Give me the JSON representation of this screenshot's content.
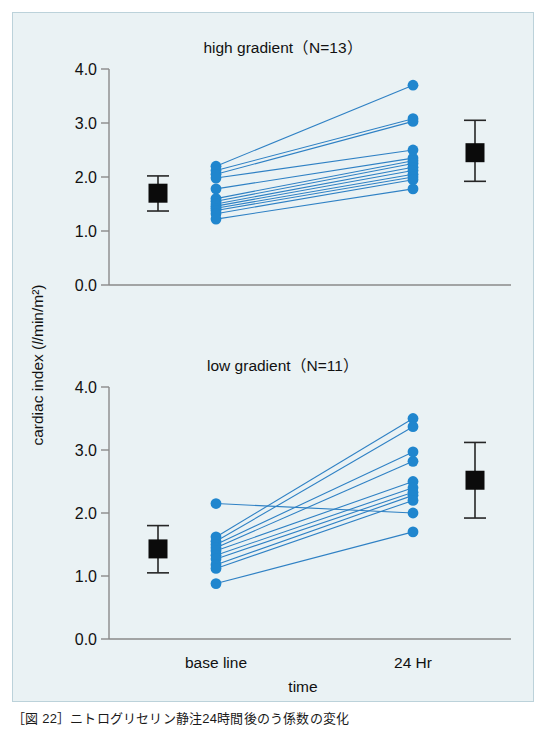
{
  "figure": {
    "caption": "［図 22］ニトログリセリン静注24時間後のう係数の変化",
    "background_color": "#eaf2f4",
    "point_color": "#2086ce",
    "link_color": "#2f81c4",
    "marker_color": "#0b0b0b"
  },
  "axes": {
    "y_label_prefix": "cardiac index (",
    "y_label_unit": "l",
    "y_label_suffix": "/min/m²)",
    "y_label_full": "cardiac index (l/min/m²)",
    "x_label": "time",
    "y_ticks": [
      "0.0",
      "1.0",
      "2.0",
      "3.0",
      "4.0"
    ],
    "x_categories": [
      "base line",
      "24 Hr"
    ]
  },
  "chart_data": [
    {
      "type": "line",
      "title": "high gradient（N=13）",
      "panel": "high-gradient",
      "n": 13,
      "xlabel": "time",
      "ylabel": "cardiac index (l/min/m²)",
      "ylim": [
        0.0,
        4.0
      ],
      "yticks": [
        0.0,
        1.0,
        2.0,
        3.0,
        4.0
      ],
      "x": [
        "base line",
        "24 Hr"
      ],
      "grid": false,
      "legend": "none",
      "series": [
        {
          "name": "subject-1",
          "values": [
            2.2,
            3.7
          ]
        },
        {
          "name": "subject-2",
          "values": [
            2.12,
            3.08
          ]
        },
        {
          "name": "subject-3",
          "values": [
            2.05,
            3.03
          ]
        },
        {
          "name": "subject-4",
          "values": [
            1.98,
            2.5
          ]
        },
        {
          "name": "subject-5",
          "values": [
            1.78,
            2.35
          ]
        },
        {
          "name": "subject-6",
          "values": [
            1.6,
            2.3
          ]
        },
        {
          "name": "subject-7",
          "values": [
            1.55,
            2.25
          ]
        },
        {
          "name": "subject-8",
          "values": [
            1.5,
            2.18
          ]
        },
        {
          "name": "subject-9",
          "values": [
            1.46,
            2.12
          ]
        },
        {
          "name": "subject-10",
          "values": [
            1.42,
            2.05
          ]
        },
        {
          "name": "subject-11",
          "values": [
            1.38,
            2.0
          ]
        },
        {
          "name": "subject-12",
          "values": [
            1.32,
            1.95
          ]
        },
        {
          "name": "subject-13",
          "values": [
            1.22,
            1.78
          ]
        }
      ],
      "summary": [
        {
          "x": "base line",
          "mean": 1.7,
          "low": 1.37,
          "high": 2.02
        },
        {
          "x": "24 Hr",
          "mean": 2.45,
          "low": 1.92,
          "high": 3.05
        }
      ]
    },
    {
      "type": "line",
      "title": "low gradient（N=11）",
      "panel": "low-gradient",
      "n": 11,
      "xlabel": "time",
      "ylabel": "cardiac index (l/min/m²)",
      "ylim": [
        0.0,
        4.0
      ],
      "yticks": [
        0.0,
        1.0,
        2.0,
        3.0,
        4.0
      ],
      "x": [
        "base line",
        "24 Hr"
      ],
      "grid": false,
      "legend": "none",
      "series": [
        {
          "name": "subject-1",
          "values": [
            1.62,
            3.5
          ]
        },
        {
          "name": "subject-2",
          "values": [
            1.55,
            3.37
          ]
        },
        {
          "name": "subject-3",
          "values": [
            1.5,
            2.97
          ]
        },
        {
          "name": "subject-4",
          "values": [
            1.45,
            2.82
          ]
        },
        {
          "name": "subject-5",
          "values": [
            1.4,
            2.5
          ]
        },
        {
          "name": "subject-6",
          "values": [
            1.33,
            2.4
          ]
        },
        {
          "name": "subject-7",
          "values": [
            1.27,
            2.33
          ]
        },
        {
          "name": "subject-8",
          "values": [
            1.18,
            2.28
          ]
        },
        {
          "name": "subject-9",
          "values": [
            1.12,
            2.2
          ]
        },
        {
          "name": "subject-10",
          "values": [
            2.15,
            2.0
          ]
        },
        {
          "name": "subject-11",
          "values": [
            0.88,
            1.7
          ]
        }
      ],
      "summary": [
        {
          "x": "base line",
          "mean": 1.43,
          "low": 1.05,
          "high": 1.8
        },
        {
          "x": "24 Hr",
          "mean": 2.52,
          "low": 1.92,
          "high": 3.12
        }
      ]
    }
  ]
}
